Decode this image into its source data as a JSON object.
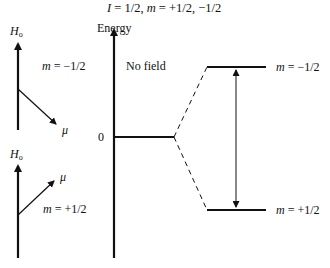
{
  "title": "I = 1/2, m = +1/2, −1/2",
  "title_parts": {
    "I": "I",
    "I_val": " = 1/2, ",
    "m": "m",
    "m_val": " = +1/2, −1/2"
  },
  "left_panels": [
    {
      "field_label": "H",
      "field_sub": "o",
      "moment_label": "μ",
      "m_label": "m",
      "m_value": " = −1/2",
      "orientation": "antiparallel"
    },
    {
      "field_label": "H",
      "field_sub": "o",
      "moment_label": "μ",
      "m_label": "m",
      "m_value": " = +1/2",
      "orientation": "parallel"
    }
  ],
  "energy_diagram": {
    "axis_label": "Energy",
    "zero_label": "0",
    "no_field_label": "No field",
    "upper_level": {
      "m_label": "m",
      "m_value": " = −1/2"
    },
    "lower_level": {
      "m_label": "m",
      "m_value": " = +1/2"
    }
  },
  "colors": {
    "line": "#111111",
    "background": "#ffffff"
  }
}
